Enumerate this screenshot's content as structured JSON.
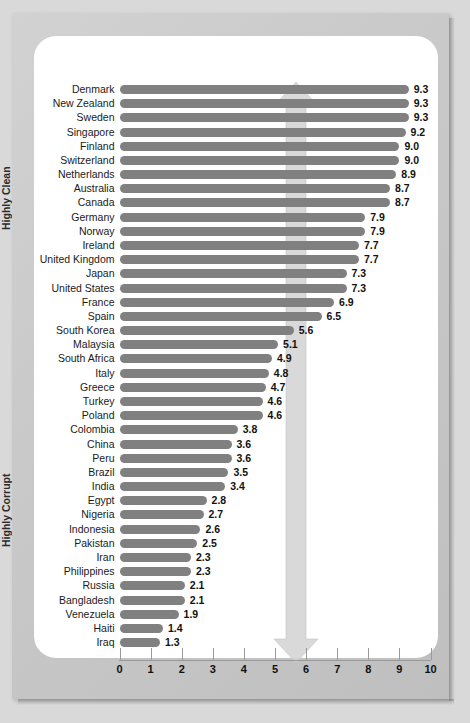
{
  "chart_data": {
    "type": "bar",
    "orientation": "horizontal",
    "title": "",
    "xlabel": "",
    "ylabel": "",
    "xlim": [
      0,
      10
    ],
    "xticks": [
      0,
      1,
      2,
      3,
      4,
      5,
      6,
      7,
      8,
      9,
      10
    ],
    "xtick_labels": [
      "0",
      "1",
      "2",
      "3",
      "4",
      "5",
      "6",
      "7",
      "8",
      "9",
      "10"
    ],
    "grid": false,
    "legend": "none",
    "bar_color": "#808080",
    "categories": [
      "Denmark",
      "New Zealand",
      "Sweden",
      "Singapore",
      "Finland",
      "Switzerland",
      "Netherlands",
      "Australia",
      "Canada",
      "Germany",
      "Norway",
      "Ireland",
      "United Kingdom",
      "Japan",
      "United States",
      "France",
      "Spain",
      "South Korea",
      "Malaysia",
      "South Africa",
      "Italy",
      "Greece",
      "Turkey",
      "Poland",
      "Colombia",
      "China",
      "Peru",
      "Brazil",
      "India",
      "Egypt",
      "Nigeria",
      "Indonesia",
      "Pakistan",
      "Iran",
      "Philippines",
      "Russia",
      "Bangladesh",
      "Venezuela",
      "Haiti",
      "Iraq"
    ],
    "values": [
      9.3,
      9.3,
      9.3,
      9.2,
      9.0,
      9.0,
      8.9,
      8.7,
      8.7,
      7.9,
      7.9,
      7.7,
      7.7,
      7.3,
      7.3,
      6.9,
      6.5,
      5.6,
      5.1,
      4.9,
      4.8,
      4.7,
      4.6,
      4.6,
      3.8,
      3.6,
      3.6,
      3.5,
      3.4,
      2.8,
      2.7,
      2.6,
      2.5,
      2.3,
      2.3,
      2.1,
      2.1,
      1.9,
      1.4,
      1.3
    ],
    "value_labels": [
      "9.3",
      "9.3",
      "9.3",
      "9.2",
      "9.0",
      "9.0",
      "8.9",
      "8.7",
      "8.7",
      "7.9",
      "7.9",
      "7.7",
      "7.7",
      "7.3",
      "7.3",
      "6.9",
      "6.5",
      "5.6",
      "5.1",
      "4.9",
      "4.8",
      "4.7",
      "4.6",
      "4.6",
      "3.8",
      "3.6",
      "3.6",
      "3.5",
      "3.4",
      "2.8",
      "2.7",
      "2.6",
      "2.5",
      "2.3",
      "2.3",
      "2.1",
      "2.1",
      "1.9",
      "1.4",
      "1.3"
    ],
    "annotations": [
      {
        "text": "Highly Clean",
        "position": "top",
        "direction": "up"
      },
      {
        "text": "Highly Corrupt",
        "position": "bottom",
        "direction": "down"
      }
    ]
  },
  "annotation_top": "Highly Clean",
  "annotation_bottom": "Highly Corrupt",
  "colors": {
    "bar": "#808080",
    "arrow": "#d0d0d0",
    "frame": "#cccccc",
    "panel": "#ffffff"
  }
}
